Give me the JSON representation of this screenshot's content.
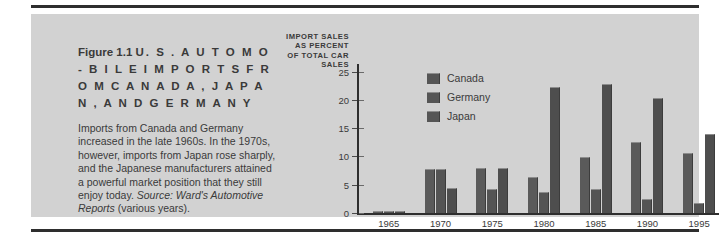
{
  "figure": {
    "number": "Figure 1.1",
    "title": "U. S .  A U T O M O - B I L E   I M P O R T S   F R O M   C A N A D A ,   J A P A N ,   A N D   G E R M A N Y",
    "body_text": "Imports from Canada and Germany increased in the late 1960s. In the 1970s, however, imports from Japan rose sharply, and the Japanese manufacturers attained a powerful market position that they still enjoy today. ",
    "source_lead": "Source:",
    "source_name": " Ward's Automotive Reports",
    "source_tail": " (various years)."
  },
  "chart_data": {
    "type": "bar",
    "title": "",
    "xlabel": "",
    "ylabel": "IMPORT SALES\nAS PERCENT\nOF TOTAL CAR\nSALES",
    "categories": [
      "1965",
      "1970",
      "1975",
      "1980",
      "1985",
      "1990",
      "1995"
    ],
    "series": [
      {
        "name": "Canada",
        "values": [
          0.3,
          7.8,
          7.9,
          6.4,
          9.9,
          12.6,
          10.6
        ]
      },
      {
        "name": "Germany",
        "values": [
          0.3,
          7.8,
          4.2,
          3.7,
          4.2,
          2.4,
          1.8
        ]
      },
      {
        "name": "Japan",
        "values": [
          0.3,
          4.4,
          7.9,
          22.3,
          22.9,
          20.3,
          13.9
        ]
      }
    ],
    "ylim": [
      0,
      26
    ],
    "yticks": [
      0,
      5,
      10,
      15,
      20,
      25
    ],
    "ytick_labels": [
      "0",
      "5",
      "10",
      "15",
      "20",
      "25"
    ],
    "grid": false,
    "legend_position": "upper-left-inside",
    "bar_color": "#555555",
    "axis_color": "#2e2e2e",
    "panel_color": "#d2d2d2"
  }
}
